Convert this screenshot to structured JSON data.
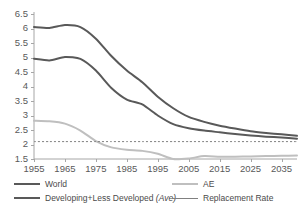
{
  "chart_data": {
    "type": "line",
    "title": "",
    "xlabel": "",
    "ylabel": "",
    "xlim": [
      1955,
      2040
    ],
    "ylim": [
      1.5,
      6.5
    ],
    "grid": false,
    "legend_position": "bottom",
    "xticks": [
      "1955",
      "1965",
      "1975",
      "1985",
      "1995",
      "2005",
      "2015",
      "2025",
      "2035"
    ],
    "xtick_values": [
      1955,
      1965,
      1975,
      1985,
      1995,
      2005,
      2015,
      2025,
      2035
    ],
    "yticks": [
      "1.5",
      "2",
      "2.5",
      "3",
      "3.5",
      "4",
      "4.5",
      "5",
      "5.5",
      "6",
      "6.5"
    ],
    "ytick_values": [
      1.5,
      2,
      2.5,
      3,
      3.5,
      4,
      4.5,
      5,
      5.5,
      6,
      6.5
    ],
    "x": [
      1955,
      1960,
      1965,
      1970,
      1975,
      1980,
      1985,
      1990,
      1995,
      2000,
      2005,
      2010,
      2015,
      2020,
      2025,
      2030,
      2035,
      2040
    ],
    "series": [
      {
        "name": "Developing+Less Developed (Ave)",
        "color": "#595959",
        "width": 2.0,
        "dash": "none",
        "values": [
          6.05,
          6.02,
          6.12,
          6.05,
          5.65,
          5.05,
          4.55,
          4.15,
          3.65,
          3.25,
          2.95,
          2.78,
          2.65,
          2.55,
          2.46,
          2.4,
          2.35,
          2.3
        ]
      },
      {
        "name": "World",
        "color": "#595959",
        "width": 2.0,
        "dash": "none",
        "values": [
          4.96,
          4.9,
          5.02,
          4.95,
          4.55,
          3.95,
          3.55,
          3.38,
          3.0,
          2.7,
          2.56,
          2.48,
          2.42,
          2.36,
          2.31,
          2.27,
          2.24,
          2.2
        ]
      },
      {
        "name": "AE",
        "color": "#bfbfbf",
        "width": 2.0,
        "dash": "none",
        "values": [
          2.82,
          2.8,
          2.72,
          2.48,
          2.12,
          1.9,
          1.82,
          1.78,
          1.68,
          1.5,
          1.52,
          1.6,
          1.58,
          1.58,
          1.59,
          1.6,
          1.61,
          1.62
        ]
      },
      {
        "name": "Replacement Rate",
        "color": "#808080",
        "width": 1.0,
        "dash": "2,2",
        "values": [
          2.1,
          2.1,
          2.1,
          2.1,
          2.1,
          2.1,
          2.1,
          2.1,
          2.1,
          2.1,
          2.1,
          2.1,
          2.1,
          2.1,
          2.1,
          2.1,
          2.1,
          2.1
        ]
      }
    ],
    "legend": [
      {
        "label": "World",
        "color": "#595959",
        "width": 2.0,
        "dash": "none"
      },
      {
        "label": "AE",
        "color": "#bfbfbf",
        "width": 2.0,
        "dash": "none"
      },
      {
        "label": "Developing+Less Developed (Ave)",
        "color": "#595959",
        "width": 2.5,
        "dash": "none",
        "italic_part": "(Ave)"
      },
      {
        "label": "Replacement Rate",
        "color": "#808080",
        "width": 1.0,
        "dash": "none"
      }
    ]
  },
  "axis": {
    "line_color": "#a6a6a6",
    "tick_color": "#a6a6a6"
  }
}
